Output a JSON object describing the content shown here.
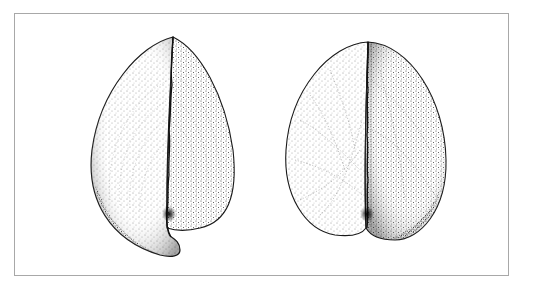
{
  "figure": {
    "frame_color": "#a8a8a8",
    "ink_color": "#1a1a1a",
    "specimens": [
      {
        "id": "left",
        "label": "lateral view with hooked base"
      },
      {
        "id": "right",
        "label": "frontal view with cleft base"
      }
    ]
  }
}
